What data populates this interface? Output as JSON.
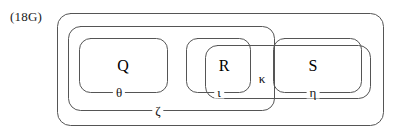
{
  "figure": {
    "tag": "(18G)",
    "type": "nested-set-diagram",
    "stroke_color": "#555555",
    "text_color": "#000000",
    "background": "#ffffff"
  },
  "elements": [
    {
      "name": "Q",
      "label": "Q",
      "cx": 123,
      "cy": 66
    },
    {
      "name": "R",
      "label": "R",
      "cx": 224,
      "cy": 66
    },
    {
      "name": "S",
      "label": "S",
      "cx": 313,
      "cy": 66
    }
  ],
  "sets": [
    {
      "name": "outer",
      "label": "",
      "x": 57,
      "y": 13,
      "w": 326,
      "h": 112,
      "r": 13,
      "label_x": 0,
      "label_y": 0
    },
    {
      "name": "zeta",
      "label": "ζ",
      "x": 68,
      "y": 26,
      "w": 206,
      "h": 84,
      "r": 12,
      "label_x": 158,
      "label_y": 110
    },
    {
      "name": "theta",
      "label": "θ",
      "x": 79,
      "y": 38,
      "w": 88,
      "h": 54,
      "r": 11,
      "label_x": 119,
      "label_y": 92
    },
    {
      "name": "iota",
      "label": "ι",
      "x": 186,
      "y": 38,
      "w": 64,
      "h": 54,
      "r": 11,
      "label_x": 219,
      "label_y": 92
    },
    {
      "name": "kappa",
      "label": "κ",
      "x": 205,
      "y": 45,
      "w": 165,
      "h": 53,
      "r": 12,
      "label_x": 262,
      "label_y": 78
    },
    {
      "name": "eta",
      "label": "η",
      "x": 273,
      "y": 38,
      "w": 88,
      "h": 54,
      "r": 11,
      "label_x": 313,
      "label_y": 92
    }
  ],
  "containment": {
    "outer_contains": [
      "zeta",
      "kappa"
    ],
    "zeta_contains": [
      "theta",
      "iota"
    ],
    "theta_contains": [
      "Q"
    ],
    "iota_contains": [
      "R"
    ],
    "kappa_contains": [
      "eta"
    ],
    "eta_contains": [
      "S"
    ]
  }
}
